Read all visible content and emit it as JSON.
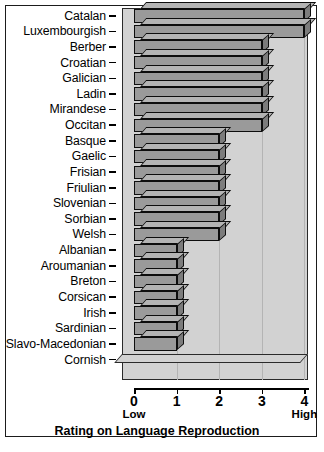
{
  "chart_data": {
    "type": "bar",
    "orientation": "horizontal",
    "title": "",
    "xlabel": "Rating on Language Reproduction",
    "ylabel": "",
    "xlim": [
      0,
      4
    ],
    "grid": true,
    "legend": null,
    "axis_low_label": "Low",
    "axis_high_label": "High",
    "xticks": [
      0,
      1,
      2,
      3,
      4
    ],
    "xticklabels": [
      "0",
      "1",
      "2",
      "3",
      "4"
    ],
    "categories": [
      "Catalan",
      "Luxembourgish",
      "Berber",
      "Croatian",
      "Galician",
      "Ladin",
      "Mirandese",
      "Occitan",
      "Basque",
      "Gaelic",
      "Frisian",
      "Friulian",
      "Slovenian",
      "Sorbian",
      "Welsh",
      "Albanian",
      "Aroumanian",
      "Breton",
      "Corsican",
      "Irish",
      "Sardinian",
      "Slavo-Macedonian",
      "Cornish"
    ],
    "values": [
      4,
      4,
      3,
      3,
      3,
      3,
      3,
      3,
      2,
      2,
      2,
      2,
      2,
      2,
      2,
      1,
      1,
      1,
      1,
      1,
      1,
      1,
      0
    ]
  },
  "colors": {
    "bar_face": "#9a9a9a",
    "bar_top": "#b4b4b4",
    "bar_side": "#7c7c7c",
    "bar_outline": "#0d0d0d",
    "plot_floor": "#d2d2d2",
    "gridline": "#b4b4b4",
    "frame": "#1b1b1b",
    "background": "#ffffff",
    "text": "#000000"
  },
  "caption": {
    "text": ""
  }
}
